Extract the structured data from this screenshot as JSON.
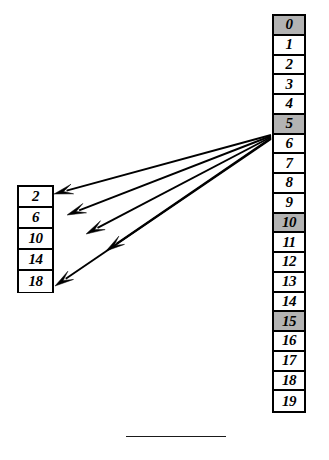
{
  "diagram": {
    "colors": {
      "ink": "#000000",
      "cell_fill": "#ffffff",
      "shaded_fill": "#b3b3b3",
      "rule": "#1a1a1a",
      "background": "#ffffff"
    }
  },
  "source_column": {
    "name": "source-column",
    "cells": [
      {
        "label": "2",
        "shaded": false
      },
      {
        "label": "6",
        "shaded": false
      },
      {
        "label": "10",
        "shaded": false
      },
      {
        "label": "14",
        "shaded": false
      },
      {
        "label": "18",
        "shaded": false
      }
    ]
  },
  "destination_column": {
    "name": "destination-column",
    "cells": [
      {
        "label": "0",
        "shaded": true
      },
      {
        "label": "1",
        "shaded": false
      },
      {
        "label": "2",
        "shaded": false
      },
      {
        "label": "3",
        "shaded": false
      },
      {
        "label": "4",
        "shaded": false
      },
      {
        "label": "5",
        "shaded": true
      },
      {
        "label": "6",
        "shaded": false
      },
      {
        "label": "7",
        "shaded": false
      },
      {
        "label": "8",
        "shaded": false
      },
      {
        "label": "9",
        "shaded": false
      },
      {
        "label": "10",
        "shaded": true
      },
      {
        "label": "11",
        "shaded": false
      },
      {
        "label": "12",
        "shaded": false
      },
      {
        "label": "13",
        "shaded": false
      },
      {
        "label": "14",
        "shaded": false
      },
      {
        "label": "15",
        "shaded": true
      },
      {
        "label": "16",
        "shaded": false
      },
      {
        "label": "17",
        "shaded": false
      },
      {
        "label": "18",
        "shaded": false
      },
      {
        "label": "19",
        "shaded": false
      }
    ]
  },
  "arrows": {
    "count": 5,
    "converge_at_cell": "5",
    "direction": "right-to-left",
    "paths": [
      {
        "from_label": "5",
        "to_label": "2",
        "x1": 271,
        "y1": 135,
        "x2": 54,
        "y2": 194
      },
      {
        "from_label": "5",
        "to_label": "6",
        "x1": 271,
        "y1": 136,
        "x2": 67,
        "y2": 215
      },
      {
        "from_label": "5",
        "to_label": "10",
        "x1": 271,
        "y1": 137,
        "x2": 86,
        "y2": 234
      },
      {
        "from_label": "5",
        "to_label": "14",
        "x1": 271,
        "y1": 138,
        "x2": 106,
        "y2": 251
      },
      {
        "from_label": "5",
        "to_label": "18",
        "x1": 271,
        "y1": 139,
        "x2": 55,
        "y2": 286
      }
    ]
  },
  "bottom_rule": {
    "name": "footnote-rule",
    "visible": true
  }
}
